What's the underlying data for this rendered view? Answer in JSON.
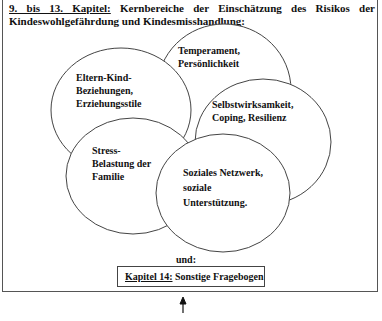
{
  "heading": {
    "chapter_ref": "9. bis 13. Kapitel:",
    "text": " Kernbereiche der Einschätzung des Risikos der Kindeswohlgefährdung und Kindesmisshandlung:"
  },
  "circles": [
    {
      "id": "temperament",
      "lines": [
        "Temperament,",
        "Persönlichkeit"
      ]
    },
    {
      "id": "selbstwirksamkeit",
      "lines": [
        "Selbstwirksamkeit,",
        "Coping, Resilienz"
      ]
    },
    {
      "id": "eltern-kind",
      "lines": [
        "Eltern-Kind-",
        "Beziehungen,",
        "Erziehungsstile"
      ]
    },
    {
      "id": "stress",
      "lines": [
        "Stress-",
        "Belastung der",
        "Familie"
      ]
    },
    {
      "id": "soziales-netzwerk",
      "lines": [
        "Soziales Netzwerk,",
        "soziale",
        "Unterstützung."
      ]
    }
  ],
  "connector": "und:",
  "footer_box": {
    "chapter_ref": "Kapitel 14:",
    "text": " Sonstige Fragebogen"
  },
  "arrow": "up-arrow"
}
